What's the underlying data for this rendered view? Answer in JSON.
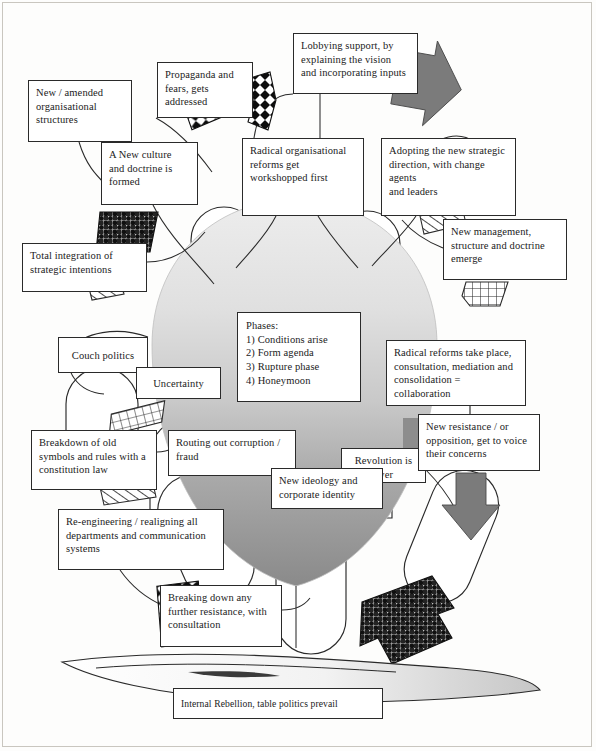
{
  "diagram": {
    "type": "annotated-callout-diagram",
    "page_size": {
      "width": 596,
      "height": 751
    },
    "palette": {
      "ink": "#2a2a2a",
      "box_fill": "#ffffff",
      "body_light": "#e4e4e4",
      "body_mid": "#bdbdbd",
      "body_dark": "#8f8f8f",
      "arrow_grey": "#7d7d7d",
      "shadow_grey": "#c3c3c3",
      "frame": "#c9c6bf"
    }
  },
  "center_panel": {
    "name": "phases-panel",
    "heading": "Phases:",
    "items": [
      "1) Conditions arise",
      "2) Form agenda",
      "3) Rupture phase",
      "4) Honeymoon"
    ],
    "text": "Phases:\n1) Conditions arise\n2) Form agenda\n3) Rupture phase\n4) Honeymoon"
  },
  "callouts": [
    {
      "id": "new-amended-organisational-structures",
      "text": "New / amended\norganisational\nstructures",
      "x": 28,
      "y": 80,
      "w": 104,
      "h": 62
    },
    {
      "id": "propaganda-and-fears",
      "text": "Propaganda and\nfears, gets\naddressed",
      "x": 157,
      "y": 62,
      "w": 96,
      "h": 56
    },
    {
      "id": "lobbying-support",
      "text": "Lobbying support, by\nexplaining the vision\nand incorporating inputs",
      "x": 293,
      "y": 33,
      "w": 125,
      "h": 61
    },
    {
      "id": "a-new-culture-and-doctrine",
      "text": "A New culture\nand doctrine is\nformed",
      "x": 101,
      "y": 142,
      "w": 97,
      "h": 63
    },
    {
      "id": "radical-organisational-reforms",
      "text": "Radical organisational\nreforms get\nworkshopped first",
      "x": 242,
      "y": 138,
      "w": 122,
      "h": 78
    },
    {
      "id": "adopting-new-strategic-direction",
      "text": "Adopting the new strategic\ndirection, with change agents\nand leaders",
      "x": 381,
      "y": 138,
      "w": 135,
      "h": 78
    },
    {
      "id": "new-management-structure-doctrine",
      "text": "New management,\nstructure and doctrine\nemerge",
      "x": 443,
      "y": 219,
      "w": 124,
      "h": 61
    },
    {
      "id": "total-integration-of-strategic-intentions",
      "text": "Total integration of\nstrategic intentions",
      "x": 22,
      "y": 243,
      "w": 125,
      "h": 49
    },
    {
      "id": "couch-politics",
      "text": "Couch politics",
      "x": 58,
      "y": 337,
      "w": 90,
      "h": 36
    },
    {
      "id": "uncertainty",
      "text": "Uncertainty",
      "x": 136,
      "y": 367,
      "w": 85,
      "h": 32
    },
    {
      "id": "radical-reforms-take-place",
      "text": "Radical reforms take place,\nconsultation, mediation and\nconsolidation = collaboration",
      "x": 386,
      "y": 340,
      "w": 140,
      "h": 66
    },
    {
      "id": "breakdown-of-old-symbols",
      "text": "Breakdown of old\nsymbols and rules with a\nconstitution law",
      "x": 31,
      "y": 430,
      "w": 126,
      "h": 60
    },
    {
      "id": "routing-out-corruption",
      "text": "Routing out corruption /\nfraud",
      "x": 168,
      "y": 430,
      "w": 128,
      "h": 46
    },
    {
      "id": "revolution-is-over",
      "text": "Revolution is\nover",
      "x": 341,
      "y": 448,
      "w": 85,
      "h": 35
    },
    {
      "id": "new-resistance-opposition",
      "text": "New resistance / or\nopposition, get to voice\ntheir concerns",
      "x": 418,
      "y": 414,
      "w": 122,
      "h": 57
    },
    {
      "id": "new-ideology-and-corporate-identity",
      "text": "New ideology and\ncorporate identity",
      "x": 271,
      "y": 468,
      "w": 112,
      "h": 41
    },
    {
      "id": "re-engineering-realigning",
      "text": "Re-engineering / realigning all\ndepartments and communication\nsystems",
      "x": 58,
      "y": 509,
      "w": 166,
      "h": 61
    },
    {
      "id": "breaking-down-any-further-resistance",
      "text": "Breaking down any\nfurther resistance, with\nconsultation",
      "x": 160,
      "y": 585,
      "w": 122,
      "h": 62
    },
    {
      "id": "internal-rebellion",
      "text": "Internal Rebellion, table politics prevail",
      "x": 173,
      "y": 688,
      "w": 210,
      "h": 31
    }
  ],
  "shapes": {
    "core": "sun-burst body with gradient from light grey at top to dark grey at bottom",
    "lobes": "eight rounded lobes / circles radiating from the central body",
    "grey_arrows": [
      "arrow-right-upper",
      "arrow-down-right"
    ],
    "checker_arrows": [
      "checker-arrow-upper-left",
      "checker-arrow-upper-mid",
      "checker-arrow-left",
      "checker-arrow-lower-left",
      "checker-arrow-lower-right"
    ],
    "grid_arrows": [
      "grid-arrow-right",
      "grid-arrow-left",
      "grid-arrow-mid-left"
    ],
    "base": "curved sweeping base / ground ribbon with grey shading at right"
  }
}
